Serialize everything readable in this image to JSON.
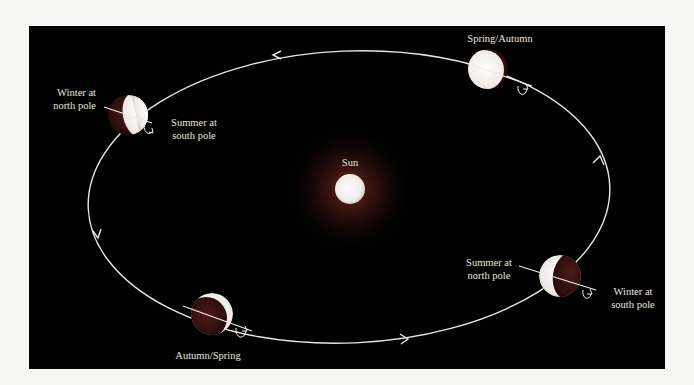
{
  "diagram": {
    "type": "earth-orbit-seasons",
    "colors": {
      "background": "#f6f6f4",
      "panel": "#020202",
      "orbit": "#e8e6e2",
      "sun": "#f4f1ee",
      "sun_glow": "#5a1f17",
      "planet_lit": "#f2efec",
      "planet_dark": "#3a1412",
      "label": "#e9e4dc"
    },
    "sun": {
      "label": "Sun"
    },
    "positions": [
      {
        "id": "left",
        "labels": {
          "north": "Winter at\nnorth pole",
          "south": "Summer at\nsouth pole"
        }
      },
      {
        "id": "top",
        "labels": {
          "season": "Spring/Autumn"
        }
      },
      {
        "id": "right",
        "labels": {
          "north": "Summer at\nnorth pole",
          "south": "Winter at\nsouth pole"
        }
      },
      {
        "id": "bottom",
        "labels": {
          "season": "Autumn/Spring"
        }
      }
    ],
    "orbit": {
      "direction": "counterclockwise",
      "arrow_count": 4
    }
  }
}
